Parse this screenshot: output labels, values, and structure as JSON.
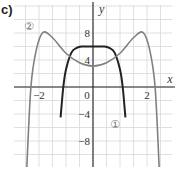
{
  "panel_label": "c)",
  "axes": {
    "x_label": "x",
    "y_label": "y"
  },
  "ticks": {
    "x": [
      {
        "value": -2,
        "label": "−2"
      },
      {
        "value": 0,
        "label": "0"
      },
      {
        "value": 2,
        "label": "2"
      }
    ],
    "y": [
      {
        "value": 8,
        "label": "8"
      },
      {
        "value": 4,
        "label": "4"
      },
      {
        "value": -4,
        "label": "−4"
      },
      {
        "value": -8,
        "label": "−8"
      }
    ]
  },
  "curve_labels": {
    "c1": "①",
    "c2": "②"
  },
  "colors": {
    "curve1": "#222222",
    "curve2": "#808080",
    "grid": "#d8d8d8",
    "axis": "#222222"
  },
  "chart_data": {
    "type": "line",
    "title": "c)",
    "xlabel": "x",
    "ylabel": "y",
    "xlim": [
      -3,
      3
    ],
    "ylim": [
      -12,
      12
    ],
    "grid": true,
    "grid_step": {
      "x": 0.5,
      "y": 2
    },
    "series": [
      {
        "name": "①",
        "color": "#222222",
        "x": [
          -1.2,
          -1.1,
          -1.0,
          -0.8,
          -0.6,
          -0.4,
          -0.2,
          0,
          0.2,
          0.4,
          0.6,
          0.8,
          1.0,
          1.1,
          1.2
        ],
        "y": [
          -4.5,
          0,
          2.6,
          5.1,
          5.8,
          6.0,
          6.0,
          6.0,
          6.0,
          6.0,
          5.8,
          5.1,
          2.6,
          0,
          -4.5
        ]
      },
      {
        "name": "②",
        "color": "#808080",
        "x": [
          -2.45,
          -2.3,
          -2.1,
          -1.85,
          -1.5,
          -1.0,
          -0.5,
          0,
          0.5,
          1.0,
          1.5,
          1.85,
          2.1,
          2.3,
          2.45
        ],
        "y": [
          -12,
          0,
          5.5,
          8.1,
          7.3,
          5.0,
          3.6,
          3.1,
          3.6,
          5.0,
          7.3,
          8.1,
          5.5,
          0,
          -12
        ]
      }
    ]
  }
}
